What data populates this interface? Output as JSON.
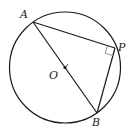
{
  "diagram": {
    "type": "geometry",
    "circle": {
      "center": "O",
      "cx": 65,
      "cy": 67.5,
      "r": 55.5
    },
    "points": {
      "A": {
        "label": "A",
        "x": 33,
        "y": 22
      },
      "P": {
        "label": "P",
        "x": 115,
        "y": 48
      },
      "B": {
        "label": "B",
        "x": 97,
        "y": 113
      },
      "O": {
        "label": "O",
        "x": 65,
        "y": 67.5
      }
    },
    "segments": [
      "AB",
      "AP",
      "PB"
    ],
    "right_angle_at": "P",
    "colors": {
      "stroke": "#1a1a1a",
      "marker": "#888888"
    }
  }
}
